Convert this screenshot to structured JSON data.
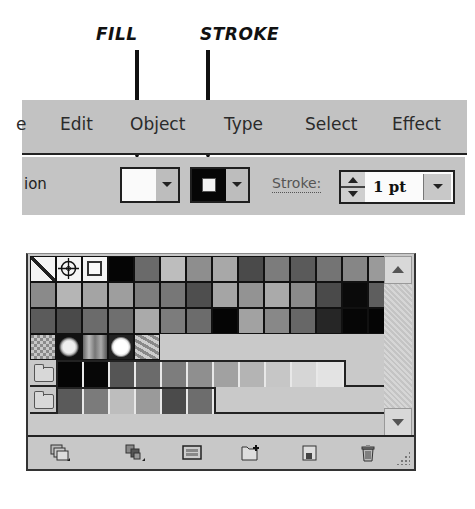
{
  "annotations": {
    "fill_label": "FILL",
    "stroke_label": "STROKE"
  },
  "menubar": {
    "items": [
      {
        "label": "e"
      },
      {
        "label": "Edit"
      },
      {
        "label": "Object"
      },
      {
        "label": "Type"
      },
      {
        "label": "Select"
      },
      {
        "label": "Effect"
      }
    ]
  },
  "controlbar": {
    "left_label": "ion",
    "fill": {
      "color": "#fafafa",
      "name": "None/White fill"
    },
    "stroke": {
      "color": "#060606"
    },
    "stroke_label": "Stroke:",
    "stroke_weight": "1 pt"
  },
  "swatches": {
    "rows": [
      [
        "none",
        "registration",
        "#f5f5f5",
        "#050505",
        "#6a6a6a",
        "#bdbdbd",
        "#8e8e8e",
        "#a8a8a8",
        "#4a4a4a",
        "#7c7c7c",
        "#5a5a5a",
        "#747474",
        "#868686",
        "#9a9a9a"
      ],
      [
        "#8a8a8a",
        "#b5b5b5",
        "#a4a4a4",
        "#9e9e9e",
        "#7d7d7d",
        "#777777",
        "#4e4e4e",
        "#a5a5a5",
        "#939393",
        "#aaaaaa",
        "#8a8a8a",
        "#4a4a4a",
        "#0a0a0a",
        "#5e5e5e"
      ],
      [
        "#5b5b5b",
        "#4a4a4a",
        "#6b6b6b",
        "#6f6f6f",
        "#aaaaaa",
        "#7c7c7c",
        "#6c6c6c",
        "#050505",
        "#a2a2a2",
        "#888888",
        "#676767",
        "#262626",
        "#060606",
        "#050505"
      ]
    ],
    "patterns": [
      "gradient-checker",
      "radial-glow",
      "linear-bars",
      "radial-white",
      "wave-pattern"
    ],
    "group1": [
      "#050505",
      "#070707",
      "#555555",
      "#6b6b6b",
      "#7d7d7d",
      "#8f8f8f",
      "#a1a1a1",
      "#b4b4b4",
      "#c6c6c6",
      "#d6d6d6",
      "#e3e3e3"
    ],
    "group2": [
      "#5a5a5a",
      "#7b7b7b",
      "#bdbdbd",
      "#9a9a9a",
      "#4b4b4b",
      "#6d6d6d"
    ]
  },
  "footer": {
    "icons": [
      "swatch-libraries-menu-icon",
      "show-swatch-kinds-menu-icon",
      "swatch-options-icon",
      "new-color-group-icon",
      "new-swatch-icon",
      "delete-swatch-icon"
    ]
  }
}
